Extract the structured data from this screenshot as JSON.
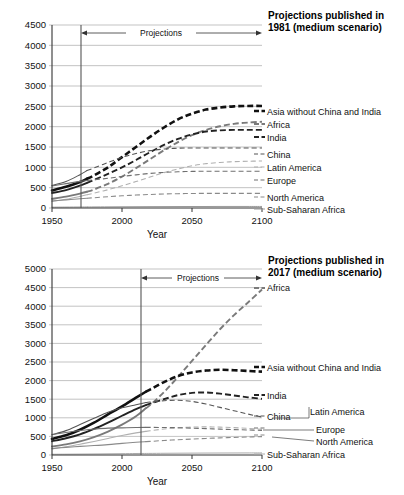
{
  "charts": [
    {
      "id": "top",
      "title_line1": "Projections published in",
      "title_line2": "1981 (medium scenario)",
      "projection_label": "Projections",
      "xlabel": "Year",
      "x_ticks": [
        "1950",
        "2000",
        "2050",
        "2100"
      ],
      "y_ticks": [
        "0",
        "500",
        "1000",
        "1500",
        "2000",
        "2500",
        "3000",
        "3500",
        "4000",
        "4500"
      ],
      "legend": [
        "Asia without China and India",
        "Africa",
        "India",
        "China",
        "Latin America",
        "Europe",
        "North America",
        "Sub-Saharan Africa"
      ]
    },
    {
      "id": "bottom",
      "title_line1": "Projections published in",
      "title_line2": "2017 (medium scenario)",
      "projection_label": "Projections",
      "xlabel": "Year",
      "x_ticks": [
        "1950",
        "2000",
        "2050",
        "2100"
      ],
      "y_ticks": [
        "0",
        "500",
        "1000",
        "1500",
        "2000",
        "2500",
        "3000",
        "3500",
        "4000",
        "4500",
        "5000"
      ],
      "legend": [
        "Africa",
        "Asia without China and India",
        "India",
        "China",
        "Latin America",
        "Europe",
        "North America",
        "Sub-Saharan Africa"
      ]
    }
  ],
  "chart_data": [
    {
      "type": "line",
      "title": "Projections published in 1981 (medium scenario)",
      "xlabel": "Year",
      "ylabel": "",
      "xlim": [
        1950,
        2100
      ],
      "ylim": [
        0,
        4500
      ],
      "xticks": [
        1950,
        2000,
        2050,
        2100
      ],
      "yticks": [
        0,
        500,
        1000,
        1500,
        2000,
        2500,
        3000,
        3500,
        4000,
        4500
      ],
      "grid": true,
      "legend_position": "right-inline",
      "annotations": [
        {
          "text": "Projections",
          "x_start": 1975,
          "x_end": 2100,
          "type": "double-arrow"
        }
      ],
      "projection_start_year": 1975,
      "x": [
        1950,
        1960,
        1970,
        1975,
        1980,
        1990,
        2000,
        2010,
        2020,
        2030,
        2040,
        2050,
        2060,
        2070,
        2080,
        2090,
        2100
      ],
      "series": [
        {
          "name": "Asia without China and India",
          "style": "thick-dashed",
          "color": "#111111",
          "values": [
            430,
            520,
            640,
            720,
            800,
            1000,
            1250,
            1500,
            1750,
            1980,
            2180,
            2320,
            2420,
            2470,
            2500,
            2510,
            2510
          ]
        },
        {
          "name": "Africa",
          "style": "medium-dashed",
          "color": "#7a7a7a",
          "values": [
            225,
            280,
            355,
            400,
            455,
            595,
            770,
            980,
            1200,
            1420,
            1620,
            1790,
            1920,
            2010,
            2070,
            2100,
            2120
          ]
        },
        {
          "name": "India",
          "style": "medium-dashed",
          "color": "#222222",
          "values": [
            370,
            440,
            550,
            620,
            690,
            840,
            1000,
            1180,
            1370,
            1550,
            1700,
            1810,
            1880,
            1910,
            1920,
            1920,
            1920
          ]
        },
        {
          "name": "China",
          "style": "thin-dashed",
          "color": "#555555",
          "values": [
            555,
            650,
            820,
            920,
            985,
            1120,
            1245,
            1340,
            1410,
            1450,
            1470,
            1475,
            1475,
            1475,
            1475,
            1475,
            1475
          ]
        },
        {
          "name": "Latin America",
          "style": "thin-dashed",
          "color": "#b0b0b0",
          "values": [
            165,
            215,
            285,
            325,
            365,
            450,
            545,
            650,
            760,
            870,
            960,
            1040,
            1090,
            1120,
            1140,
            1150,
            1155
          ]
        },
        {
          "name": "Europe",
          "style": "thin-dashed",
          "color": "#6f6f6f",
          "values": [
            545,
            600,
            655,
            675,
            695,
            730,
            775,
            815,
            850,
            875,
            890,
            900,
            905,
            905,
            905,
            905,
            905
          ]
        },
        {
          "name": "North America",
          "style": "thin-dashed",
          "color": "#8a8a8a",
          "values": [
            172,
            200,
            227,
            240,
            252,
            278,
            300,
            318,
            333,
            345,
            352,
            357,
            360,
            360,
            360,
            360,
            360
          ]
        },
        {
          "name": "Sub-Saharan Africa",
          "style": "thin-solid-flat",
          "color": "#999999",
          "values": [
            20,
            22,
            24,
            25,
            26,
            28,
            30,
            32,
            34,
            35,
            36,
            37,
            37,
            38,
            38,
            38,
            38
          ]
        }
      ]
    },
    {
      "type": "line",
      "title": "Projections published in 2017 (medium scenario)",
      "xlabel": "Year",
      "ylabel": "",
      "xlim": [
        1950,
        2100
      ],
      "ylim": [
        0,
        5000
      ],
      "xticks": [
        1950,
        2000,
        2050,
        2100
      ],
      "yticks": [
        0,
        500,
        1000,
        1500,
        2000,
        2500,
        3000,
        3500,
        4000,
        4500,
        5000
      ],
      "grid": true,
      "legend_position": "right-inline",
      "annotations": [
        {
          "text": "Projections",
          "x_start": 2017,
          "x_end": 2100,
          "type": "double-arrow"
        }
      ],
      "projection_start_year": 2017,
      "x": [
        1950,
        1960,
        1970,
        1980,
        1990,
        2000,
        2010,
        2017,
        2020,
        2030,
        2040,
        2050,
        2060,
        2070,
        2080,
        2090,
        2100
      ],
      "series": [
        {
          "name": "Africa",
          "style": "medium-dashed",
          "color": "#7a7a7a",
          "values": [
            230,
            285,
            365,
            480,
            630,
            815,
            1040,
            1255,
            1340,
            1690,
            2100,
            2530,
            2960,
            3380,
            3760,
            4100,
            4450
          ]
        },
        {
          "name": "Asia without China and India",
          "style": "thick-dashed",
          "color": "#111111",
          "values": [
            435,
            530,
            680,
            870,
            1090,
            1310,
            1540,
            1700,
            1760,
            1960,
            2120,
            2220,
            2270,
            2290,
            2280,
            2260,
            2240
          ]
        },
        {
          "name": "India",
          "style": "medium-dashed",
          "color": "#222222",
          "values": [
            370,
            450,
            555,
            700,
            870,
            1055,
            1235,
            1340,
            1380,
            1500,
            1610,
            1670,
            1680,
            1650,
            1600,
            1550,
            1510
          ]
        },
        {
          "name": "China",
          "style": "thin-dashed",
          "color": "#555555",
          "values": [
            545,
            655,
            820,
            985,
            1150,
            1270,
            1350,
            1410,
            1425,
            1460,
            1470,
            1440,
            1370,
            1280,
            1190,
            1100,
            1020
          ]
        },
        {
          "name": "Latin America",
          "style": "thin-dashed",
          "color": "#b0b0b0",
          "values": [
            170,
            220,
            290,
            365,
            445,
            525,
            595,
            635,
            650,
            700,
            730,
            750,
            755,
            750,
            735,
            715,
            690
          ]
        },
        {
          "name": "Europe",
          "style": "thin-dashed",
          "color": "#6f6f6f",
          "values": [
            550,
            605,
            660,
            695,
            722,
            730,
            738,
            742,
            742,
            740,
            733,
            722,
            710,
            695,
            683,
            672,
            660
          ]
        },
        {
          "name": "North America",
          "style": "thin-dashed",
          "color": "#8a8a8a",
          "values": [
            172,
            205,
            232,
            254,
            280,
            313,
            343,
            360,
            365,
            390,
            410,
            428,
            445,
            460,
            472,
            483,
            495
          ]
        },
        {
          "name": "Sub-Saharan Africa",
          "style": "thin-solid-flat",
          "color": "#aaaaaa",
          "values": [
            20,
            22,
            25,
            28,
            32,
            36,
            40,
            42,
            43,
            46,
            48,
            50,
            52,
            53,
            54,
            55,
            56
          ]
        }
      ]
    }
  ]
}
